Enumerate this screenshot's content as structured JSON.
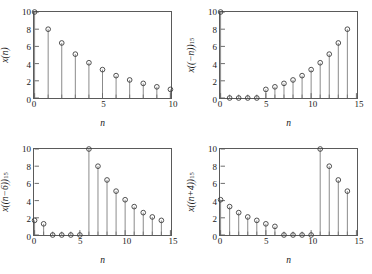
{
  "figure": {
    "background": "#ffffff",
    "axis_color": "#5a5a5a",
    "marker_color": "#3a3a3a",
    "stem_color": "#6a6a6a"
  },
  "chart_data": [
    {
      "type": "stem",
      "panel": "top-left",
      "title": "",
      "xlabel": "n",
      "ylabel": "x(n)",
      "ylabel_parts": {
        "main": "x(n)",
        "sub": ""
      },
      "xlim": [
        0,
        10
      ],
      "ylim": [
        0,
        10
      ],
      "xticks": [
        0,
        5,
        10
      ],
      "xticklabels": [
        "0",
        "5",
        "10"
      ],
      "xminorticks": [
        1,
        2,
        3,
        4,
        6,
        7,
        8,
        9
      ],
      "yticks": [
        0,
        2,
        4,
        6,
        8,
        10
      ],
      "yticklabels": [
        "0",
        "2",
        "4",
        "6",
        "8",
        "10"
      ],
      "grid": false,
      "marker": "open-circle",
      "x": [
        0,
        1,
        2,
        3,
        4,
        5,
        6,
        7,
        8,
        9,
        10
      ],
      "values": [
        10.0,
        8.0,
        6.4,
        5.1,
        4.1,
        3.3,
        2.6,
        2.1,
        1.7,
        1.3,
        1.0
      ]
    },
    {
      "type": "stem",
      "panel": "top-right",
      "title": "",
      "xlabel": "n",
      "ylabel": "x((-n))15",
      "ylabel_parts": {
        "main": "x((−n))",
        "sub": "15"
      },
      "xlim": [
        0,
        15
      ],
      "ylim": [
        0,
        10
      ],
      "xticks": [
        0,
        5,
        10,
        15
      ],
      "xticklabels": [
        "0",
        "5",
        "10",
        "15"
      ],
      "xminorticks": [
        1,
        2,
        3,
        4,
        6,
        7,
        8,
        9,
        11,
        12,
        13,
        14
      ],
      "yticks": [
        0,
        2,
        4,
        6,
        8,
        10
      ],
      "yticklabels": [
        "0",
        "2",
        "4",
        "6",
        "8",
        "10"
      ],
      "grid": false,
      "marker": "open-circle",
      "x": [
        0,
        1,
        2,
        3,
        4,
        5,
        6,
        7,
        8,
        9,
        10,
        11,
        12,
        13,
        14
      ],
      "values": [
        10.0,
        0.0,
        0.0,
        0.0,
        0.0,
        1.0,
        1.3,
        1.7,
        2.1,
        2.6,
        3.3,
        4.1,
        5.1,
        6.4,
        8.0
      ]
    },
    {
      "type": "stem",
      "panel": "bottom-left",
      "title": "",
      "xlabel": "n",
      "ylabel": "x((n-6))15",
      "ylabel_parts": {
        "main": "x((n−6))",
        "sub": "15"
      },
      "xlim": [
        0,
        15
      ],
      "ylim": [
        0,
        10
      ],
      "xticks": [
        0,
        5,
        10,
        15
      ],
      "xticklabels": [
        "0",
        "5",
        "10",
        "15"
      ],
      "xminorticks": [
        1,
        2,
        3,
        4,
        6,
        7,
        8,
        9,
        11,
        12,
        13,
        14
      ],
      "yticks": [
        0,
        2,
        4,
        6,
        8,
        10
      ],
      "yticklabels": [
        "0",
        "2",
        "4",
        "6",
        "8",
        "10"
      ],
      "grid": false,
      "marker": "open-circle",
      "x": [
        0,
        1,
        2,
        3,
        4,
        5,
        6,
        7,
        8,
        9,
        10,
        11,
        12,
        13,
        14
      ],
      "values": [
        1.7,
        1.3,
        0.0,
        0.0,
        0.0,
        0.0,
        10.0,
        8.0,
        6.4,
        5.1,
        4.1,
        3.3,
        2.6,
        2.1,
        1.7
      ]
    },
    {
      "type": "stem",
      "panel": "bottom-right",
      "title": "",
      "xlabel": "n",
      "ylabel": "x((n+4))15",
      "ylabel_parts": {
        "main": "x((n+4))",
        "sub": "15"
      },
      "xlim": [
        0,
        15
      ],
      "ylim": [
        0,
        10
      ],
      "xticks": [
        0,
        5,
        10,
        15
      ],
      "xticklabels": [
        "0",
        "5",
        "10",
        "15"
      ],
      "xminorticks": [
        1,
        2,
        3,
        4,
        6,
        7,
        8,
        9,
        11,
        12,
        13,
        14
      ],
      "yticks": [
        0,
        2,
        4,
        6,
        8,
        10
      ],
      "yticklabels": [
        "0",
        "2",
        "4",
        "6",
        "8",
        "10"
      ],
      "grid": false,
      "marker": "open-circle",
      "x": [
        0,
        1,
        2,
        3,
        4,
        5,
        6,
        7,
        8,
        9,
        10,
        11,
        12,
        13,
        14
      ],
      "values": [
        4.1,
        3.3,
        2.6,
        2.1,
        1.7,
        1.3,
        1.0,
        0.0,
        0.0,
        0.0,
        0.0,
        10.0,
        8.0,
        6.4,
        5.1
      ]
    }
  ]
}
